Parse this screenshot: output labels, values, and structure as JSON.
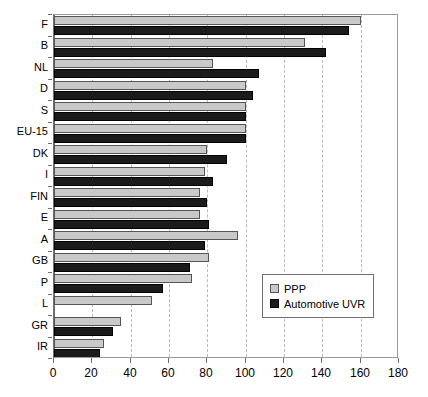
{
  "chart_data": {
    "type": "bar",
    "orientation": "horizontal",
    "title": "",
    "subtitle": "",
    "xlabel": "",
    "ylabel": "",
    "xlim": [
      0,
      180
    ],
    "xticks": [
      0,
      20,
      40,
      60,
      80,
      100,
      120,
      140,
      160,
      180
    ],
    "grid": true,
    "grid_axis": "x",
    "legend_position": "right-lower",
    "categories": [
      "F",
      "B",
      "NL",
      "D",
      "S",
      "EU-15",
      "DK",
      "I",
      "FIN",
      "E",
      "A",
      "GB",
      "P",
      "L",
      "GR",
      "IR"
    ],
    "series": [
      {
        "name": "PPP",
        "color": "#c9c9c9",
        "values": [
          160,
          131,
          83,
          100,
          100,
          100,
          80,
          79,
          76,
          76,
          96,
          81,
          72,
          51,
          35,
          26
        ]
      },
      {
        "name": "Automotive UVR",
        "color": "#1b1b1b",
        "values": [
          154,
          142,
          107,
          104,
          100,
          100,
          90,
          83,
          80,
          81,
          79,
          71,
          57,
          null,
          31,
          24
        ]
      }
    ]
  },
  "legend": {
    "items": [
      {
        "label": "PPP",
        "swatch": "ppp"
      },
      {
        "label": "Automotive UVR",
        "swatch": "uvr"
      }
    ]
  }
}
